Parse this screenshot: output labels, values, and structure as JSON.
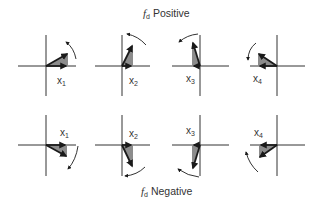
{
  "titles": {
    "top": {
      "symbol": "f",
      "subscript": "d",
      "text": "Positive"
    },
    "bottom": {
      "symbol": "f",
      "subscript": "d",
      "text": "Negative"
    }
  },
  "colors": {
    "axis": "#333333",
    "fill": "#8c8c8c",
    "vector": "#1a1a1a",
    "text": "#333333"
  },
  "rows": [
    {
      "name": "fd-positive",
      "panels": [
        {
          "label": "x",
          "index": "1",
          "rotation": "counterclockwise"
        },
        {
          "label": "x",
          "index": "2",
          "rotation": "counterclockwise"
        },
        {
          "label": "x",
          "index": "3",
          "rotation": "counterclockwise"
        },
        {
          "label": "x",
          "index": "4",
          "rotation": "counterclockwise"
        }
      ]
    },
    {
      "name": "fd-negative",
      "panels": [
        {
          "label": "x",
          "index": "1",
          "rotation": "clockwise"
        },
        {
          "label": "x",
          "index": "2",
          "rotation": "clockwise"
        },
        {
          "label": "x",
          "index": "3",
          "rotation": "clockwise"
        },
        {
          "label": "x",
          "index": "4",
          "rotation": "clockwise"
        }
      ]
    }
  ]
}
